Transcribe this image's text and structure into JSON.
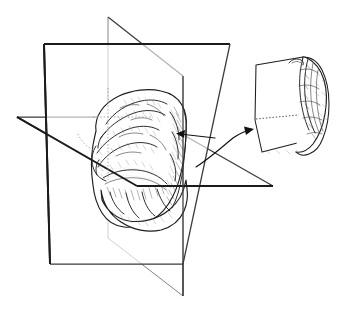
{
  "figure": {
    "type": "anatomical line drawing",
    "background_color": "#ffffff",
    "ink_color": "#1b1b1b",
    "labels": []
  },
  "subject": {
    "name": "human-brain",
    "view": "left-anterior-oblique",
    "rendering": "pen-and-ink hatching and stipple shading",
    "fill_color": "#ffffff",
    "outline_color": "#1d1d1d"
  },
  "planes": [
    {
      "id": "coronal",
      "name": "coronal-plane",
      "orientation": "frontal / vertical, facing viewer",
      "stroke_color": "#1b1b1b",
      "stroke_weight": "bold",
      "corners": [
        [
          44,
          44
        ],
        [
          230,
          44
        ],
        [
          183,
          264
        ],
        [
          50,
          264
        ]
      ]
    },
    {
      "id": "sagittal",
      "name": "sagittal-plane",
      "orientation": "median / vertical, receding right",
      "stroke_color": "#3a3a3a",
      "stroke_weight": "medium",
      "corners": [
        [
          108,
          17
        ],
        [
          183,
          76
        ],
        [
          183,
          296
        ],
        [
          108,
          238
        ]
      ]
    },
    {
      "id": "axial",
      "name": "axial-plane",
      "orientation": "horizontal / transverse",
      "stroke_color": "#3a3a3a",
      "stroke_weight": "medium",
      "corners": [
        [
          17,
          117
        ],
        [
          152,
          117
        ],
        [
          273,
          186
        ],
        [
          137,
          186
        ]
      ]
    }
  ],
  "annotations": [
    {
      "id": "slab-indicator",
      "name": "slab-thickness-arrow",
      "kind": "straight-arrow",
      "direction": "points-left-into-cut-face",
      "from": [
        215,
        137
      ],
      "to": [
        176,
        134
      ],
      "color": "#111111"
    },
    {
      "id": "extraction",
      "name": "extraction-curved-arrow",
      "kind": "curved-arrow",
      "direction": "from-brain-to-inset",
      "from": [
        196,
        166
      ],
      "to": [
        251,
        132
      ],
      "color": "#111111"
    }
  ],
  "inset": {
    "id": "coronal-slab",
    "name": "extracted-coronal-slab",
    "description": "removed slab of brain tissue showing flat cut face and convoluted cortical surface",
    "bounds": [
      248,
      52,
      88,
      108
    ],
    "cut_face_edge": "dotted",
    "stroke_color": "#1d1d1d"
  },
  "colors": {
    "background": "#ffffff",
    "primary_ink": "#1b1b1b",
    "secondary_ink": "#3a3a3a",
    "light_ink": "#8d8d8d",
    "hidden_line": "#9a9a9a"
  }
}
